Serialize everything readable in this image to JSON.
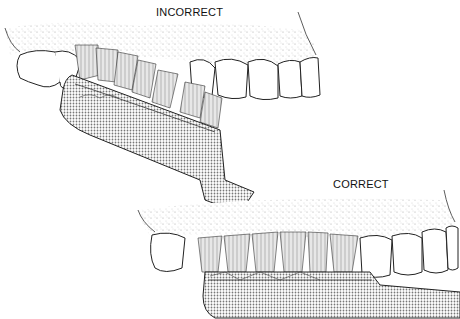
{
  "figure": {
    "panels": [
      {
        "label": "INCORRECT",
        "description": "Toothbrush held flat against upper teeth at an angle"
      },
      {
        "label": "CORRECT",
        "description": "Toothbrush bristles angled toward gumline along upper teeth"
      }
    ],
    "colors": {
      "line": "#222222",
      "stipple": "#9a9a9a",
      "handle_fill": "#cfcfcf",
      "background": "#ffffff"
    }
  }
}
